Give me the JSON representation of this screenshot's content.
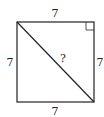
{
  "diagram": {
    "shape": "square",
    "side_top_label": "7",
    "side_left_label": "7",
    "side_right_label": "7",
    "side_bottom_label": "7",
    "diagonal_label": "?",
    "right_angle_marker": "top-right",
    "stroke_color": "#222222"
  }
}
